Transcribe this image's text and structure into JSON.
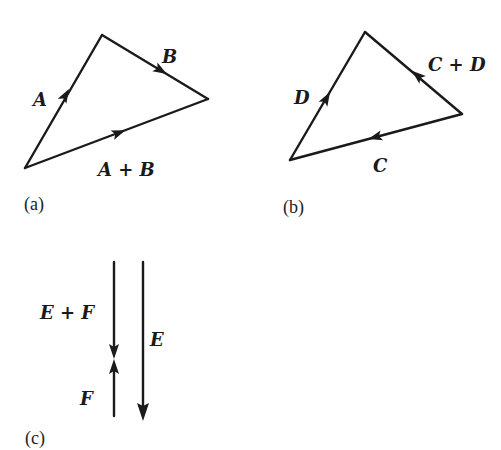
{
  "figure": {
    "panels": [
      {
        "id": "a",
        "caption": "(a)",
        "vectors": [
          {
            "name": "A",
            "label": "A"
          },
          {
            "name": "B",
            "label": "B"
          },
          {
            "name": "A+B",
            "label": "A + B"
          }
        ]
      },
      {
        "id": "b",
        "caption": "(b)",
        "vectors": [
          {
            "name": "D",
            "label": "D"
          },
          {
            "name": "C+D",
            "label": "C + D"
          },
          {
            "name": "C",
            "label": "C"
          }
        ]
      },
      {
        "id": "c",
        "caption": "(c)",
        "vectors": [
          {
            "name": "E+F",
            "label": "E + F"
          },
          {
            "name": "F",
            "label": "F"
          },
          {
            "name": "E",
            "label": "E"
          }
        ]
      }
    ]
  }
}
